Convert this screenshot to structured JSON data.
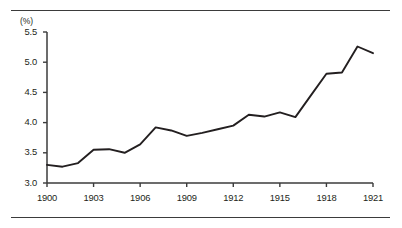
{
  "figure": {
    "unit_label": "(%)",
    "line_color": "#231f20",
    "axis_color": "#3b3b3b",
    "rule_color": "#3b3b3b",
    "background": "#ffffff"
  },
  "chart_data": {
    "type": "line",
    "title": "",
    "subtitle": "",
    "xlabel": "",
    "ylabel": "(%)",
    "grid": false,
    "legend": "none",
    "xlim": [
      1900,
      1921
    ],
    "ylim": [
      3.0,
      5.5
    ],
    "ytick_labels": [
      "5.5",
      "5.0",
      "4.5",
      "4.0",
      "3.5",
      "3.0"
    ],
    "ytick_values": [
      5.5,
      5.0,
      4.5,
      4.0,
      3.5,
      3.0
    ],
    "xtick_labels": [
      "1900",
      "1903",
      "1906",
      "1909",
      "1912",
      "1915",
      "1918",
      "1921"
    ],
    "xtick_values": [
      1900,
      1903,
      1906,
      1909,
      1912,
      1915,
      1918,
      1921
    ],
    "x": [
      1900,
      1901,
      1902,
      1903,
      1904,
      1905,
      1906,
      1907,
      1908,
      1909,
      1910,
      1911,
      1912,
      1913,
      1914,
      1915,
      1916,
      1917,
      1918,
      1919,
      1920,
      1921
    ],
    "values": [
      3.3,
      3.27,
      3.33,
      3.55,
      3.56,
      3.5,
      3.64,
      3.92,
      3.87,
      3.78,
      3.83,
      3.89,
      3.95,
      4.13,
      4.1,
      4.17,
      4.09,
      4.45,
      4.81,
      4.83,
      5.26,
      5.15
    ],
    "series": [
      {
        "name": "",
        "values": [
          3.3,
          3.27,
          3.33,
          3.55,
          3.56,
          3.5,
          3.64,
          3.92,
          3.87,
          3.78,
          3.83,
          3.89,
          3.95,
          4.13,
          4.1,
          4.17,
          4.09,
          4.45,
          4.81,
          4.83,
          5.26,
          5.15
        ]
      }
    ]
  }
}
